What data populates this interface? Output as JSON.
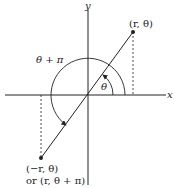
{
  "diagram": {
    "axes": {
      "x_label": "x",
      "y_label": "y"
    },
    "point": {
      "label": "(r, θ)"
    },
    "opposite_point": {
      "label_line1": "(−r, θ)",
      "label_line2": "or (r, θ + π)"
    },
    "angle_small_label": "θ",
    "angle_large_label": "θ + π",
    "colors": {
      "ink": "#222222"
    }
  }
}
